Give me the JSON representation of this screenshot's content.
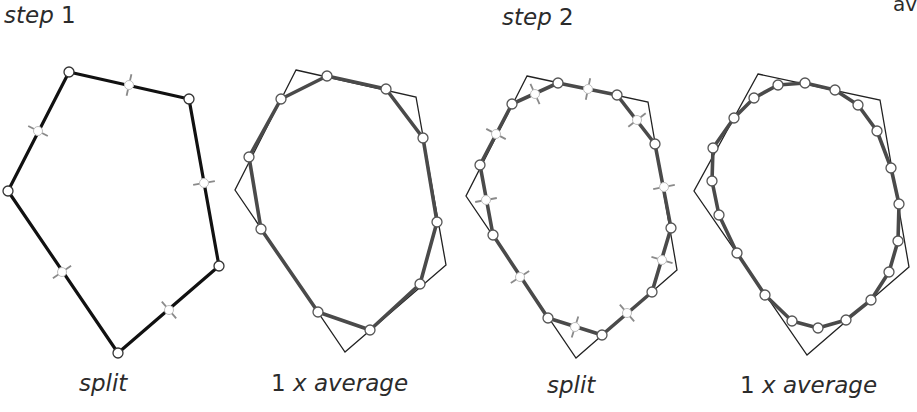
{
  "headers": {
    "step1": {
      "word": "step",
      "num": "1"
    },
    "step2": {
      "word": "step",
      "num": "2"
    },
    "cutoff": "av"
  },
  "captions": [
    {
      "prefix": "",
      "text": "split"
    },
    {
      "prefix": "1",
      "text": "x average"
    },
    {
      "prefix": "",
      "text": "split"
    },
    {
      "prefix": "1",
      "text": "x average"
    }
  ],
  "colors": {
    "original_polygon": "#111111",
    "smoothed_polygon": "#4a4a4a",
    "reference_outline": "#222222",
    "vertex_fill": "#ffffff",
    "vertex_stroke": "#555555",
    "split_marker": "#8a8a8a"
  },
  "panels": [
    {
      "name": "step1-split",
      "reference": [],
      "polygon": [
        [
          69,
          72
        ],
        [
          189,
          99
        ],
        [
          219,
          266
        ],
        [
          118,
          353
        ],
        [
          8,
          191
        ]
      ],
      "polygon_style": "original",
      "midpoints": [
        [
          129,
          85
        ],
        [
          204,
          183
        ],
        [
          169,
          310
        ],
        [
          62,
          272
        ],
        [
          38,
          131
        ]
      ]
    },
    {
      "name": "step1-average",
      "reference": [
        [
          296,
          70
        ],
        [
          416,
          97
        ],
        [
          446,
          265
        ],
        [
          345,
          352
        ],
        [
          235,
          190
        ]
      ],
      "polygon": [
        [
          281,
          99
        ],
        [
          327,
          76
        ],
        [
          386,
          89
        ],
        [
          423,
          138
        ],
        [
          437,
          222
        ],
        [
          420,
          284
        ],
        [
          370,
          330
        ],
        [
          318,
          312
        ],
        [
          261,
          229
        ],
        [
          249,
          157
        ]
      ],
      "polygon_style": "smoothed",
      "midpoints": []
    },
    {
      "name": "step2-split",
      "reference": [
        [
          527,
          76
        ],
        [
          648,
          102
        ],
        [
          677,
          270
        ],
        [
          576,
          358
        ],
        [
          466,
          196
        ]
      ],
      "polygon": [
        [
          512,
          104
        ],
        [
          558,
          83
        ],
        [
          617,
          95
        ],
        [
          655,
          144
        ],
        [
          671,
          228
        ],
        [
          652,
          292
        ],
        [
          602,
          335
        ],
        [
          548,
          318
        ],
        [
          493,
          235
        ],
        [
          480,
          165
        ]
      ],
      "polygon_style": "smoothed",
      "midpoints": [
        [
          535,
          94
        ],
        [
          588,
          89
        ],
        [
          637,
          120
        ],
        [
          664,
          187
        ],
        [
          662,
          260
        ],
        [
          627,
          313
        ],
        [
          575,
          327
        ],
        [
          520,
          277
        ],
        [
          486,
          200
        ],
        [
          496,
          134
        ]
      ]
    },
    {
      "name": "step2-average",
      "reference": [
        [
          758,
          74
        ],
        [
          880,
          100
        ],
        [
          909,
          267
        ],
        [
          807,
          355
        ],
        [
          694,
          191
        ]
      ],
      "polygon": [
        [
          734,
          118
        ],
        [
          754,
          98
        ],
        [
          778,
          85
        ],
        [
          805,
          83
        ],
        [
          835,
          90
        ],
        [
          858,
          105
        ],
        [
          877,
          131
        ],
        [
          891,
          168
        ],
        [
          899,
          204
        ],
        [
          898,
          241
        ],
        [
          889,
          272
        ],
        [
          871,
          300
        ],
        [
          846,
          320
        ],
        [
          818,
          328
        ],
        [
          792,
          321
        ],
        [
          765,
          295
        ],
        [
          737,
          253
        ],
        [
          719,
          215
        ],
        [
          712,
          181
        ],
        [
          713,
          148
        ]
      ],
      "polygon_style": "smoothed",
      "midpoints": []
    }
  ]
}
